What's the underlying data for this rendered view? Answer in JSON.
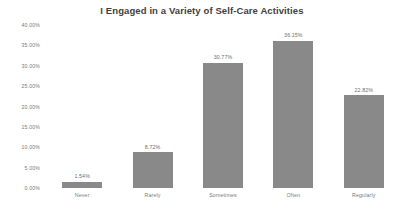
{
  "chart_data": {
    "type": "bar",
    "title": "I Engaged in a Variety of Self-Care Activities",
    "xlabel": "",
    "ylabel": "",
    "categories": [
      "Never",
      "Rarely",
      "Sometimes",
      "Often",
      "Regularly"
    ],
    "values": [
      1.54,
      8.72,
      30.77,
      36.15,
      22.82
    ],
    "value_labels": [
      "1.54%",
      "8.72%",
      "30.77%",
      "36.15%",
      "22.82%"
    ],
    "ylim": [
      0,
      40
    ],
    "ytick_values": [
      0,
      5,
      10,
      15,
      20,
      25,
      30,
      35,
      40
    ],
    "ytick_labels": [
      "0.00%",
      "5.00%",
      "10.00%",
      "15.00%",
      "20.00%",
      "25.00%",
      "30.00%",
      "35.00%",
      "40.00%"
    ],
    "grid": false,
    "legend": false,
    "bar_color": "#898989",
    "background_color": "#ffffff",
    "title_color": "#3f3f3f",
    "label_color": "#7a7a7a"
  },
  "footer": {
    "clipped_text": ""
  }
}
